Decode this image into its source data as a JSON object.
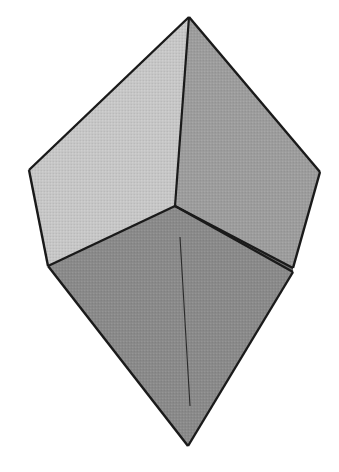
{
  "figure": {
    "type": "line-drawing",
    "style": "halftone-shaded polyhedron",
    "canvas": {
      "width": 339,
      "height": 472,
      "background": "#ffffff"
    },
    "palette": {
      "background": "#ffffff",
      "face_light": "#c6c6c6",
      "face_medium": "#9d9d9d",
      "face_dark": "#8a8a8a",
      "face_sliver": "#6f6f6f",
      "edge_stroke": "#1a1a1a",
      "interior_line": "#2a2a2a"
    },
    "vertices": {
      "top": {
        "x": 189,
        "y": 17,
        "label": "top apex"
      },
      "left": {
        "x": 29,
        "y": 170,
        "label": "left vertex"
      },
      "right": {
        "x": 320,
        "y": 172,
        "label": "right vertex"
      },
      "center": {
        "x": 175,
        "y": 206,
        "label": "central vertex"
      },
      "lower_left": {
        "x": 48,
        "y": 266,
        "label": "lower-left vertex"
      },
      "lower_right": {
        "x": 293,
        "y": 272,
        "label": "lower-right vertex"
      },
      "bottom": {
        "x": 188,
        "y": 446,
        "label": "bottom apex"
      }
    },
    "faces": [
      {
        "name": "upper-left-face",
        "shade": "light",
        "fill": "#c6c6c6",
        "points": "189,17 29,170 48,266 175,206"
      },
      {
        "name": "upper-right-face",
        "shade": "medium",
        "fill": "#9d9d9d",
        "points": "189,17 320,172 293,268 175,206"
      },
      {
        "name": "lower-front-face",
        "shade": "dark",
        "fill": "#8a8a8a",
        "points": "175,206 293,272 188,446 48,266"
      },
      {
        "name": "right-sliver-face",
        "shade": "sliver",
        "fill": "#6f6f6f",
        "points": "175,206 293,268 293,272"
      }
    ],
    "edges": [
      {
        "name": "edge-top-to-left",
        "x1": 189,
        "y1": 17,
        "x2": 29,
        "y2": 170,
        "width": 2.4
      },
      {
        "name": "edge-top-to-right",
        "x1": 189,
        "y1": 17,
        "x2": 320,
        "y2": 172,
        "width": 2.4
      },
      {
        "name": "edge-top-to-center",
        "x1": 189,
        "y1": 17,
        "x2": 175,
        "y2": 206,
        "width": 2.2
      },
      {
        "name": "edge-left-to-lowerleft",
        "x1": 29,
        "y1": 170,
        "x2": 48,
        "y2": 266,
        "width": 2.4
      },
      {
        "name": "edge-right-to-lowerright",
        "x1": 320,
        "y1": 172,
        "x2": 293,
        "y2": 268,
        "width": 2.4
      },
      {
        "name": "edge-center-to-lowerleft",
        "x1": 175,
        "y1": 206,
        "x2": 48,
        "y2": 266,
        "width": 2.4
      },
      {
        "name": "edge-center-to-lowerright-upper",
        "x1": 175,
        "y1": 206,
        "x2": 293,
        "y2": 268,
        "width": 2.2
      },
      {
        "name": "edge-center-to-lowerright-lower",
        "x1": 175,
        "y1": 206,
        "x2": 293,
        "y2": 272,
        "width": 2.2
      },
      {
        "name": "edge-lowerleft-to-bottom",
        "x1": 48,
        "y1": 266,
        "x2": 188,
        "y2": 446,
        "width": 2.4
      },
      {
        "name": "edge-lowerright-to-bottom",
        "x1": 293,
        "y1": 272,
        "x2": 188,
        "y2": 446,
        "width": 2.4
      }
    ],
    "interior_lines": [
      {
        "name": "front-face-crease",
        "x1": 180,
        "y1": 237,
        "x2": 190,
        "y2": 406,
        "width": 1.1
      }
    ]
  }
}
